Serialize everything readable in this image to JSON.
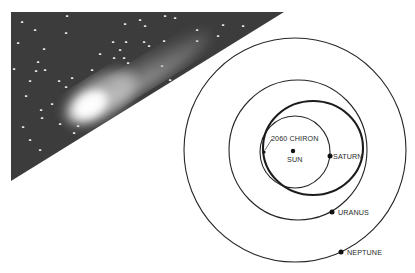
{
  "figure": {
    "photo": {
      "subject": "comet-photograph",
      "background_color": "#3c3c3c",
      "stars": [
        [
          22,
          22
        ],
        [
          67,
          16
        ],
        [
          140,
          20
        ],
        [
          165,
          16
        ],
        [
          125,
          24
        ],
        [
          145,
          26
        ],
        [
          175,
          18
        ],
        [
          197,
          30
        ],
        [
          223,
          25
        ],
        [
          243,
          26
        ],
        [
          18,
          43
        ],
        [
          35,
          30
        ],
        [
          66,
          33
        ],
        [
          126,
          42
        ],
        [
          44,
          49
        ],
        [
          149,
          46
        ],
        [
          113,
          42
        ],
        [
          164,
          41
        ],
        [
          144,
          42
        ],
        [
          38,
          62
        ],
        [
          124,
          58
        ],
        [
          162,
          66
        ],
        [
          72,
          78
        ],
        [
          36,
          71
        ],
        [
          45,
          70
        ],
        [
          14,
          69
        ],
        [
          30,
          81
        ],
        [
          59,
          81
        ],
        [
          128,
          63
        ],
        [
          170,
          80
        ],
        [
          218,
          36
        ],
        [
          197,
          41
        ],
        [
          114,
          58
        ],
        [
          100,
          54
        ],
        [
          120,
          50
        ],
        [
          92,
          70
        ],
        [
          66,
          87
        ],
        [
          26,
          96
        ],
        [
          52,
          104
        ],
        [
          41,
          110
        ],
        [
          42,
          118
        ],
        [
          23,
          127
        ],
        [
          60,
          124
        ],
        [
          78,
          126
        ],
        [
          40,
          150
        ],
        [
          74,
          133
        ],
        [
          30,
          140
        ]
      ],
      "comet": {
        "head_x": 88,
        "head_y": 107,
        "tail_to_x": 205,
        "tail_to_y": 38
      }
    },
    "diagram": {
      "orbits": [
        {
          "name": "neptune-orbit",
          "cx": 295,
          "cy": 150,
          "rx": 111,
          "ry": 112
        },
        {
          "name": "uranus-orbit",
          "cx": 298,
          "cy": 150,
          "rx": 69,
          "ry": 70
        },
        {
          "name": "saturn-orbit",
          "cx": 295,
          "cy": 152,
          "rx": 35,
          "ry": 36
        },
        {
          "name": "chiron-orbit",
          "cx": 313,
          "cy": 148,
          "rx": 50,
          "ry": 47
        }
      ],
      "bodies": {
        "sun": {
          "label": "SUN",
          "x": 293,
          "y": 151
        },
        "saturn": {
          "label": "SATURN",
          "x": 330,
          "y": 156
        },
        "uranus": {
          "label": "URANUS",
          "x": 332,
          "y": 212
        },
        "neptune": {
          "label": "NEPTUNE",
          "x": 341,
          "y": 252
        },
        "chiron": {
          "label": "2060 CHIRON",
          "x": 264,
          "y": 152
        }
      }
    }
  }
}
